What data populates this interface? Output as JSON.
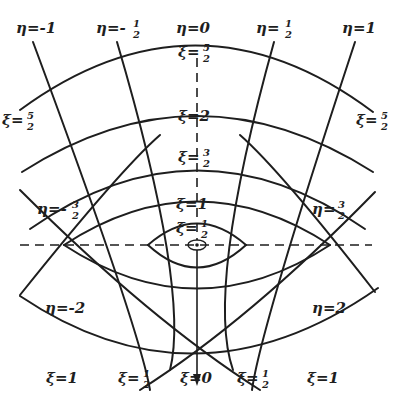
{
  "figure": {
    "focus_marker": "small-ellipse-with-point",
    "colors": {
      "ink": "#1e1e1e",
      "background": "#ffffff"
    }
  },
  "labels": {
    "eta_top": [
      {
        "id": "eta-m1",
        "text": "η=-1"
      },
      {
        "id": "eta-m-half",
        "text": "η=-",
        "num": "1",
        "den": "2"
      },
      {
        "id": "eta-0",
        "text": "η=0"
      },
      {
        "id": "eta-half",
        "text": "η=",
        "num": "1",
        "den": "2"
      },
      {
        "id": "eta-1",
        "text": "η=1"
      }
    ],
    "eta_side": [
      {
        "id": "eta-m3-2",
        "text": "η=-",
        "num": "3",
        "den": "2"
      },
      {
        "id": "eta-3-2",
        "text": "η=",
        "num": "3",
        "den": "2"
      },
      {
        "id": "eta-m2",
        "text": "η=-2"
      },
      {
        "id": "eta-2",
        "text": "η=2"
      }
    ],
    "xi_axis": [
      {
        "id": "xi-5-2-top",
        "text": "ξ=",
        "num": "5",
        "den": "2"
      },
      {
        "id": "xi-2",
        "text": "ξ=2"
      },
      {
        "id": "xi-3-2",
        "text": "ξ=",
        "num": "3",
        "den": "2"
      },
      {
        "id": "xi-1-center",
        "text": "ξ=1"
      },
      {
        "id": "xi-1-2-center",
        "text": "ξ=",
        "num": "1",
        "den": "2"
      }
    ],
    "xi_side": [
      {
        "id": "xi-5-2-left",
        "text": "ξ=",
        "num": "5",
        "den": "2"
      },
      {
        "id": "xi-5-2-right",
        "text": "ξ=",
        "num": "5",
        "den": "2"
      }
    ],
    "xi_bottom": [
      {
        "id": "xi-1-left",
        "text": "ξ=1"
      },
      {
        "id": "xi-1-2-left",
        "text": "ξ=",
        "num": "1",
        "den": "2"
      },
      {
        "id": "xi-0",
        "text": "ξ=0"
      },
      {
        "id": "xi-1-2-right",
        "text": "ξ=",
        "num": "1",
        "den": "2"
      },
      {
        "id": "xi-1-right",
        "text": "ξ=1"
      }
    ]
  }
}
